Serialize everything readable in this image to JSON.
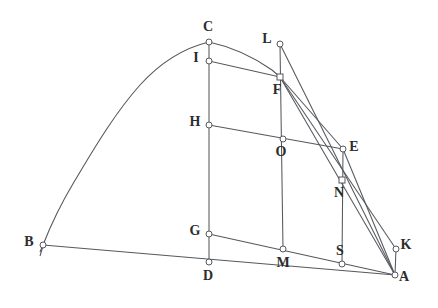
{
  "figure": {
    "background_artifact_text": "bleed-through text",
    "stroke_color": "#55585c",
    "label_color": "#2c2c2c",
    "node_fill": "#ffffff",
    "points": [
      {
        "id": "A",
        "label": "A",
        "x": 395,
        "y": 275,
        "label_dx": 9,
        "label_dy": 6,
        "marker": "circle"
      },
      {
        "id": "B",
        "label": "B",
        "x": 43,
        "y": 245,
        "label_dx": -14,
        "label_dy": 1,
        "marker": "circle"
      },
      {
        "id": "C",
        "label": "C",
        "x": 209,
        "y": 42,
        "label_dx": -1,
        "label_dy": -11,
        "marker": "circle"
      },
      {
        "id": "D",
        "label": "D",
        "x": 209,
        "y": 262,
        "label_dx": -1,
        "label_dy": 18,
        "marker": "circle"
      },
      {
        "id": "E",
        "label": "E",
        "x": 343,
        "y": 149,
        "label_dx": 11,
        "label_dy": 2,
        "marker": "circle"
      },
      {
        "id": "F",
        "label": "F",
        "x": 280,
        "y": 77,
        "label_dx": -3,
        "label_dy": 17,
        "marker": "square"
      },
      {
        "id": "G",
        "label": "G",
        "x": 209,
        "y": 234,
        "label_dx": -14,
        "label_dy": 1,
        "marker": "circle"
      },
      {
        "id": "H",
        "label": "H",
        "x": 209,
        "y": 125,
        "label_dx": -14,
        "label_dy": 1,
        "marker": "circle"
      },
      {
        "id": "I",
        "label": "I",
        "x": 209,
        "y": 61,
        "label_dx": -13,
        "label_dy": 1,
        "marker": "circle"
      },
      {
        "id": "K",
        "label": "K",
        "x": 396,
        "y": 249,
        "label_dx": 10,
        "label_dy": 0,
        "marker": "circle"
      },
      {
        "id": "L",
        "label": "L",
        "x": 280,
        "y": 44,
        "label_dx": -13,
        "label_dy": -1,
        "marker": "circle"
      },
      {
        "id": "M",
        "label": "M",
        "x": 283,
        "y": 249,
        "label_dx": 0,
        "label_dy": 18,
        "marker": "circle"
      },
      {
        "id": "N",
        "label": "N",
        "x": 342,
        "y": 180,
        "label_dx": -3,
        "label_dy": 17,
        "marker": "square"
      },
      {
        "id": "O",
        "label": "O",
        "x": 283,
        "y": 139,
        "label_dx": -2,
        "label_dy": 17,
        "marker": "circle"
      },
      {
        "id": "S",
        "label": "S",
        "x": 342,
        "y": 264,
        "label_dx": -2,
        "label_dy": -9,
        "marker": "circle"
      }
    ],
    "segments": [
      {
        "id": "seg-B-A",
        "from": "B",
        "to": "A"
      },
      {
        "id": "seg-C-D",
        "from": "C",
        "to": "D"
      },
      {
        "id": "seg-L-M",
        "from": "L",
        "to": "M"
      },
      {
        "id": "seg-E-S",
        "from": "E",
        "to": "S"
      },
      {
        "id": "seg-K-A",
        "from": "K",
        "to": "A"
      },
      {
        "id": "seg-I-F",
        "from": "I",
        "to": "F"
      },
      {
        "id": "seg-H-E",
        "from": "H",
        "to": "E"
      },
      {
        "id": "seg-G-A",
        "from": "G",
        "to": "A"
      },
      {
        "id": "seg-F-E",
        "from": "F",
        "to": "E"
      },
      {
        "id": "seg-E-A",
        "from": "E",
        "to": "A"
      },
      {
        "id": "seg-F-A",
        "from": "F",
        "to": "A"
      },
      {
        "id": "seg-L-A",
        "from": "L",
        "to": "A"
      },
      {
        "id": "seg-F-K",
        "from": "F",
        "to": "K"
      }
    ],
    "curve": {
      "id": "arc-B-C-F",
      "description": "smooth arc from B through apex C continuing to F",
      "path": "M 40 252 L 43 245 C 52 222 62 202 74 182 C 92 152 114 114 140 85 C 160 63 184 48 209 42 C 232 47 255 58 272 70 L 280 77"
    }
  }
}
